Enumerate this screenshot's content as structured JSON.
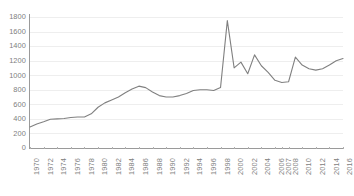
{
  "chart_data": {
    "type": "line",
    "title": "",
    "subtitle": "",
    "xlabel": "",
    "ylabel": "",
    "ylim": [
      0,
      1800
    ],
    "ytick_labels": [
      "1800",
      "1600",
      "1400",
      "1200",
      "1000",
      "800",
      "600",
      "400",
      "200",
      "0"
    ],
    "ytick_values": [
      1800,
      1600,
      1400,
      1200,
      1000,
      800,
      600,
      400,
      200,
      0
    ],
    "ytick_step": 200,
    "grid": true,
    "grid_axis": "y",
    "legend": false,
    "legend_position": "none",
    "xtick_labels": [
      "1970",
      "1972",
      "1974",
      "1976",
      "1978",
      "1980",
      "1982",
      "1984",
      "1986",
      "1988",
      "1990",
      "1992",
      "1994",
      "1996",
      "1998",
      "2000",
      "2002",
      "2004",
      "2006",
      "2007",
      "2008",
      "2010",
      "2012",
      "2014",
      "2016"
    ],
    "xtick_rotation": -90,
    "x": [
      1970,
      1971,
      1972,
      1973,
      1974,
      1975,
      1976,
      1977,
      1978,
      1979,
      1980,
      1981,
      1982,
      1983,
      1984,
      1985,
      1986,
      1987,
      1988,
      1989,
      1990,
      1991,
      1992,
      1993,
      1994,
      1995,
      1996,
      1997,
      1998,
      1999,
      2000,
      2001,
      2002,
      2003,
      2004,
      2005,
      2006,
      2007,
      2008,
      2009,
      2010,
      2011,
      2012,
      2013,
      2014,
      2015,
      2016
    ],
    "values": [
      290,
      330,
      360,
      395,
      400,
      405,
      420,
      425,
      425,
      470,
      560,
      620,
      660,
      700,
      760,
      810,
      850,
      830,
      770,
      720,
      700,
      700,
      720,
      750,
      790,
      800,
      800,
      790,
      830,
      1750,
      1100,
      1180,
      1020,
      1280,
      1130,
      1040,
      930,
      900,
      910,
      1250,
      1140,
      1090,
      1070,
      1090,
      1140,
      1200,
      1230
    ],
    "colors": {
      "line": "#808080",
      "grid": "#eeeeee",
      "axis": "#9a9a9a",
      "tick_label": "#808080",
      "background": "#ffffff"
    },
    "line_width": 1.1
  }
}
